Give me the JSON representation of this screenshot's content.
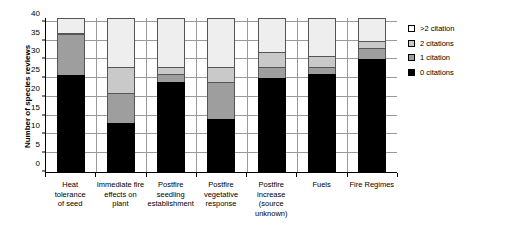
{
  "chart_data": {
    "type": "bar",
    "subtype": "stacked",
    "title": "",
    "xlabel": "",
    "ylabel": "Number of species reviews",
    "ylim": [
      0,
      41
    ],
    "yticks": [
      0,
      5,
      10,
      15,
      20,
      25,
      30,
      35,
      40
    ],
    "grid": true,
    "legend_position": "right",
    "categories": [
      "Heat tolerance of seed",
      "Immediate fire effects on plant",
      "Postfire seedling establishment",
      "Postfire vegetative response",
      "Postfire increase (source unknown)",
      "Fuels",
      "Fire Regimes"
    ],
    "category_lines": [
      [
        "Heat tolerance",
        "of seed"
      ],
      [
        "Immediate fire",
        "effects on",
        "plant"
      ],
      [
        "Postfire",
        "seedling",
        "establishment"
      ],
      [
        "Postfire",
        "vegetative",
        "response"
      ],
      [
        "Postfire",
        "increase",
        "(source",
        "unknown)"
      ],
      [
        "Fuels"
      ],
      [
        "Fire Regimes"
      ]
    ],
    "series": [
      {
        "name": "0 citations",
        "color": "#000000",
        "values": [
          26,
          13,
          24,
          14,
          25,
          26,
          30
        ]
      },
      {
        "name": "1 citation",
        "color": "#9e9e9e",
        "values": [
          11,
          8,
          2,
          10,
          3,
          2,
          3
        ]
      },
      {
        "name": "2 citations",
        "color": "#c9c9c9",
        "values": [
          0,
          7,
          2,
          4,
          4,
          3,
          2
        ]
      },
      {
        "name": ">2 citation",
        "color": "#eeeeee",
        "values": [
          4,
          13,
          13,
          13,
          9,
          10,
          6
        ]
      }
    ],
    "cumulative_tops": [
      [
        26,
        37,
        37,
        41
      ],
      [
        13,
        21,
        28,
        41
      ],
      [
        24,
        26,
        28,
        41
      ],
      [
        14,
        24,
        28,
        41
      ],
      [
        25,
        28,
        32,
        41
      ],
      [
        26,
        28,
        31,
        41
      ],
      [
        30,
        33,
        35,
        41
      ]
    ]
  },
  "legend": {
    "items": [
      {
        "label": ">2 citation",
        "swatch": "swatch-gt2-citation"
      },
      {
        "label": "2 citations",
        "swatch": "swatch-2-citations"
      },
      {
        "label": "1 citation",
        "swatch": "swatch-1-citation"
      },
      {
        "label": "0 citations",
        "swatch": "swatch-0-citations"
      }
    ]
  }
}
